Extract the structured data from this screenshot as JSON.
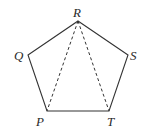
{
  "diagram": {
    "type": "geometry",
    "shape": "pentagon",
    "vertices": [
      {
        "label": "R",
        "x": 78,
        "y": 21,
        "lx": 77,
        "ly": 17
      },
      {
        "label": "S",
        "x": 128,
        "y": 55,
        "lx": 133,
        "ly": 60
      },
      {
        "label": "T",
        "x": 109,
        "y": 111,
        "lx": 112,
        "ly": 125
      },
      {
        "label": "P",
        "x": 47,
        "y": 111,
        "lx": 41,
        "ly": 125
      },
      {
        "label": "Q",
        "x": 28,
        "y": 55,
        "lx": 19,
        "ly": 60
      }
    ],
    "solid_edges": [
      "RS",
      "ST",
      "TP",
      "PQ",
      "QR"
    ],
    "dashed_edges": [
      "RP",
      "RT"
    ],
    "colors": {
      "stroke": "#333333",
      "label": "#2a2a2a",
      "background": "#ffffff"
    }
  }
}
